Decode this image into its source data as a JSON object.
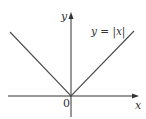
{
  "figure": {
    "function_label": "y = |x|",
    "y_axis_label": "y",
    "x_axis_label": "x",
    "origin_label": "0",
    "axis_color": "#333333",
    "curve_color": "#4a4a4a"
  }
}
